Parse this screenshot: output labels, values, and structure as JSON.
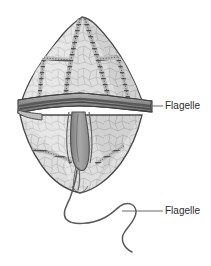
{
  "figure": {
    "kind": "biological-diagram",
    "background_color": "#ffffff"
  },
  "labels": [
    {
      "id": "transverse",
      "text": "Flagelle",
      "text_x": 165,
      "text_y": 106,
      "leader": {
        "x1": 151,
        "y1": 106,
        "x2": 163,
        "y2": 106
      }
    },
    {
      "id": "longitudinal",
      "text": "Flagelle",
      "text_x": 165,
      "text_y": 211,
      "leader": {
        "x1": 122,
        "y1": 211,
        "x2": 163,
        "y2": 211
      }
    }
  ],
  "colors": {
    "outline": "#4a4a4a",
    "plate_fill": "#dcdcdc",
    "plate_fill_light": "#e8e8e8",
    "plate_fill_dark": "#c9c9c9",
    "suture": "#5b5b5b",
    "groove_fill": "#9a9a9a",
    "groove_dark": "#6e6e6e",
    "flagellum": "#5a5a5a",
    "label_text": "#2b2b2b",
    "leader_line": "#6b6b6b",
    "texture_line": "#b2b2b2"
  },
  "cell": {
    "apex_x": 82,
    "apex_y": 17,
    "cingulum_y": 106,
    "cingulum_left_x": 18,
    "cingulum_right_x": 152,
    "antapex_x": 80,
    "antapex_y": 192,
    "epitheca_label": "epitheca",
    "hypotheca_label": "hypotheca",
    "cingulum_label": "cingulum",
    "sulcus_label": "sulcus"
  },
  "structures": [
    {
      "name": "epitheca",
      "description": "upper theca with thecal plates and ladder sutures"
    },
    {
      "name": "cingulum",
      "description": "transverse girdle groove housing transverse flagellum"
    },
    {
      "name": "hypotheca",
      "description": "lower theca with thecal plates"
    },
    {
      "name": "sulcus",
      "description": "longitudinal groove on hypotheca"
    },
    {
      "name": "transverse-flagellum",
      "description": "ribbon flagellum within cingulum"
    },
    {
      "name": "longitudinal-flagellum",
      "description": "trailing flagellum with sinusoidal waves"
    }
  ]
}
